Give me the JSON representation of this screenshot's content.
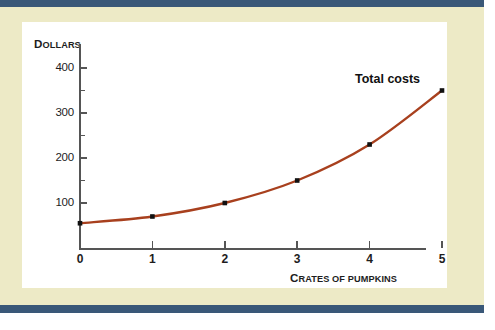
{
  "figure": {
    "card_background": "#ffffff",
    "page_background": "#edeac6",
    "rule_color": "#3a5878"
  },
  "axis_titles": {
    "y_first": "D",
    "y_rest": "OLLARS",
    "x_first": "C",
    "x_rest": "RATES OF PUMPKINS"
  },
  "series_annotation": {
    "label": "Total costs"
  },
  "chart_data": {
    "type": "line",
    "title": "",
    "subtitle": "",
    "xlabel": "Crates of pumpkins",
    "ylabel": "Dollars",
    "x": [
      0,
      1,
      2,
      3,
      4,
      5
    ],
    "xtick_labels": [
      "0",
      "1",
      "2",
      "3",
      "4",
      "5"
    ],
    "ytick_labels": [
      "100",
      "200",
      "300",
      "400"
    ],
    "ytick_values": [
      100,
      200,
      300,
      400
    ],
    "yminor_values": [
      150,
      250,
      350
    ],
    "xlim": [
      0,
      5
    ],
    "ylim": [
      0,
      430
    ],
    "grid": false,
    "legend": "none",
    "axis_break": true,
    "series": [
      {
        "name": "Total costs",
        "color": "#a8401e",
        "marker": "square",
        "marker_color": "#111111",
        "values": [
          55,
          70,
          100,
          150,
          230,
          350
        ]
      }
    ]
  }
}
